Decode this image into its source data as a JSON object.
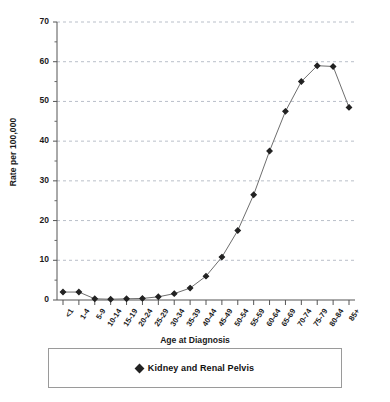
{
  "chart_data": {
    "type": "line",
    "title": "",
    "xlabel": "Age at Diagnosis",
    "ylabel": "Rate per 100,000",
    "ylim": [
      0,
      70
    ],
    "ytick_interval": 10,
    "yticks": [
      0,
      10,
      20,
      30,
      40,
      50,
      60,
      70
    ],
    "grid": "horizontal-dashed",
    "legend_position": "bottom",
    "marker": "diamond",
    "line_color": "#6e6e6e",
    "marker_color": "#222222",
    "categories": [
      "<1",
      "1-4",
      "5-9",
      "10-14",
      "15-19",
      "20-24",
      "25-29",
      "30-34",
      "35-39",
      "40-44",
      "45-49",
      "50-54",
      "55-59",
      "60-64",
      "65-69",
      "70-74",
      "75-79",
      "80-84",
      "85+"
    ],
    "series": [
      {
        "name": "Kidney and Renal Pelvis",
        "values": [
          2.0,
          2.0,
          0.3,
          0.2,
          0.3,
          0.4,
          0.8,
          1.6,
          3.0,
          6.0,
          10.8,
          17.5,
          26.5,
          37.5,
          47.5,
          55.0,
          59.0,
          58.8,
          48.5
        ]
      }
    ]
  },
  "axes": {
    "y_title": "Rate per 100,000",
    "x_title": "Age at Diagnosis",
    "y_tick_labels": [
      "70",
      "60",
      "50",
      "40",
      "30",
      "20",
      "10",
      "0"
    ]
  },
  "legend": {
    "entries": [
      {
        "label": "Kidney and Renal Pelvis",
        "marker": "diamond-marker"
      }
    ]
  }
}
